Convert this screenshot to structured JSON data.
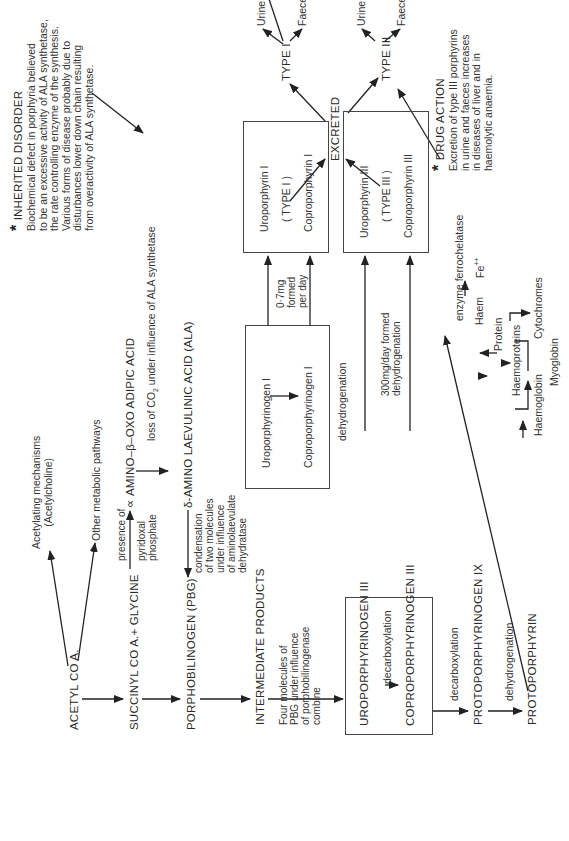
{
  "diagram": {
    "orientation": "rotated-90-ccw",
    "main_chain": {
      "acetyl_coa": "ACETYL  CO  A.",
      "succinyl": "SUCCINYL CO A.+ GLYCINE",
      "pbg": "PORPHOBILINOGEN (PBG)",
      "intermediate": "INTERMEDIATE PRODUCTS",
      "four_molecules": [
        "Four molecules of",
        "PBG under influence",
        "of porphobilinogenase",
        "combine"
      ],
      "protoporphyrinogen": "PROTOPORPHYRINOGEN IX",
      "protoporphyrin": "PROTOPORPHYRIN",
      "decarboxylation_1": "decarboxylation",
      "dehydrogenation_1": "dehydrogenation"
    },
    "acetyl_branches": {
      "acetylating": [
        "Acetylating mechanisms",
        "(Acetylcholine)"
      ],
      "other": "Other metabolic pathways"
    },
    "ala_path": {
      "presence_of": "presence of",
      "pyridoxal": [
        "pyridoxal",
        "phosphate"
      ],
      "alpha_amino": "∝ AMINO–β–OXO ADIPIC  ACID",
      "loss_co2_prefix": "loss of CO",
      "loss_co2_sub": "2",
      "loss_co2_suffix": " under influence of  ALA synthetase",
      "delta_ala": "δ-AMINO LAEVULINIC ACID (ALA)",
      "condensation": [
        "condensation",
        "of two molecules",
        "under influence",
        "of aminolaevulate",
        "dehydratase"
      ]
    },
    "type1_box": {
      "uroporphyrinogen": "Uroporphyrinogen I",
      "coproporphyrinogen": "Coproporphyrinogen I"
    },
    "type1_formed": [
      "0·7mg",
      "formed",
      "per day"
    ],
    "type1_product_box": {
      "uroporphyrin": "Uroporphyrin  I",
      "type": "( TYPE I )",
      "coproporphyrin": "Coproporphyrin I"
    },
    "type3_box": {
      "uroporphyrinogen": "UROPORPHYRINOGEN  III",
      "decarboxylation": "decarboxylation",
      "coproporphyrinogen": "COPROPORPHYRINOGEN III"
    },
    "dehydrogenation_mid": "dehydrogenation",
    "type3_formed": [
      "300mg/day formed",
      "dehydrogenation"
    ],
    "type3_product_box": {
      "uroporphyrin": "Uroporphyrin III",
      "type": "( TYPE III )",
      "coproporphyrin": "Coproporphyrin III"
    },
    "excretion": {
      "excreted": "EXCRETED",
      "type1": "TYPE I",
      "type3": "TYPE III",
      "type1_urine": "Urine 100  µg  porphyrin/day",
      "type1_faeces": "Faeces 600 µg porphyrin/day",
      "type3_urine": "Urine 50 µg porphyrin/day",
      "type3_faeces": "Faeces 150 µg porphyrin/day"
    },
    "haem": {
      "enzyme": "enzyme ferrochelatase",
      "fe": "Fe",
      "fe_sup": "++",
      "haem": "Haem",
      "protein": "Protein",
      "haemoproteins": "Haemoproteins",
      "cytochromes": "Cytochromes",
      "haemoglobin": "Haemoglobin",
      "myoglobin": "Myoglobin"
    },
    "inherited_disorder": {
      "star": "*",
      "title": "INHERITED DISORDER",
      "lines": [
        "Biochemical defect in porphyria believed",
        "to be an excessive activity of ALA synthetase,",
        "the rate controlling enzyme of the synthesis.",
        "Various forms  of disease probably due to",
        "disturbances lower down chain resulting",
        "from overactivity of  ALA  synthetase."
      ]
    },
    "drug_action": {
      "star": "*",
      "title": "DRUG  ACTION",
      "lines": [
        "Excretion of type III porphyrins",
        "in urine and faeces increases",
        "in diseases of liver and in",
        "haemolytic anaemia."
      ]
    }
  }
}
